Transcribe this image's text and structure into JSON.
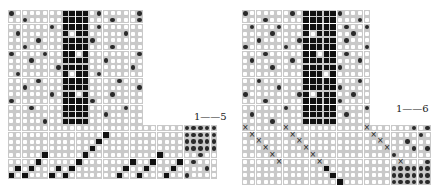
{
  "figure": {
    "panels": [
      {
        "id": "left",
        "origin": [
          8,
          10
        ],
        "cell": 6.75,
        "upper_cols": 20,
        "upper_rows": 17,
        "lower_cols": 31,
        "lower_rows": 8,
        "label": "1——5",
        "label_pos": [
          194,
          111
        ],
        "upper_fill_cols": [
          8,
          9,
          10,
          11
        ],
        "upper_dots": [
          [
            0,
            0
          ],
          [
            9,
            0
          ],
          [
            13,
            0
          ],
          [
            19,
            0
          ],
          [
            2,
            1
          ],
          [
            15,
            1
          ],
          [
            19,
            1
          ],
          [
            6,
            2
          ],
          [
            13,
            2
          ],
          [
            1,
            3
          ],
          [
            17,
            3
          ],
          [
            4,
            4
          ],
          [
            9,
            4
          ],
          [
            12,
            4
          ],
          [
            2,
            5
          ],
          [
            15,
            5
          ],
          [
            0,
            6
          ],
          [
            5,
            6
          ],
          [
            11,
            6
          ],
          [
            19,
            6
          ],
          [
            3,
            7
          ],
          [
            14,
            7
          ],
          [
            7,
            8
          ],
          [
            18,
            8
          ],
          [
            1,
            9
          ],
          [
            13,
            9
          ],
          [
            4,
            10
          ],
          [
            10,
            10
          ],
          [
            16,
            10
          ],
          [
            2,
            11
          ],
          [
            19,
            11
          ],
          [
            6,
            12
          ],
          [
            15,
            12
          ],
          [
            0,
            13
          ],
          [
            12,
            13
          ],
          [
            3,
            14
          ],
          [
            17,
            14
          ],
          [
            8,
            15
          ],
          [
            14,
            15
          ],
          [
            5,
            16
          ]
        ],
        "upper_fill_gaps": [
          [
            9,
            3
          ],
          [
            10,
            6
          ],
          [
            9,
            9
          ],
          [
            10,
            12
          ]
        ],
        "lower_fill": [
          [
            14,
            1
          ],
          [
            13,
            2
          ],
          [
            12,
            3
          ],
          [
            11,
            4
          ],
          [
            10,
            5
          ],
          [
            4,
            5
          ],
          [
            9,
            6
          ],
          [
            3,
            6
          ],
          [
            8,
            7
          ],
          [
            2,
            7
          ],
          [
            1,
            6
          ],
          [
            0,
            7
          ],
          [
            5,
            4
          ],
          [
            6,
            7
          ],
          [
            7,
            6
          ],
          [
            17,
            6
          ],
          [
            16,
            7
          ],
          [
            22,
            4
          ],
          [
            21,
            5
          ],
          [
            20,
            6
          ],
          [
            19,
            7
          ],
          [
            18,
            5
          ],
          [
            23,
            7
          ],
          [
            24,
            6
          ],
          [
            25,
            5
          ]
        ],
        "treadle_fill": [
          [
            26,
            0
          ],
          [
            27,
            0
          ],
          [
            28,
            0
          ],
          [
            29,
            0
          ],
          [
            30,
            0
          ],
          [
            26,
            1
          ],
          [
            27,
            1
          ],
          [
            28,
            1
          ],
          [
            29,
            1
          ],
          [
            30,
            1
          ],
          [
            26,
            2
          ],
          [
            27,
            2
          ],
          [
            28,
            2
          ],
          [
            29,
            2
          ],
          [
            30,
            2
          ],
          [
            26,
            3
          ],
          [
            27,
            3
          ],
          [
            28,
            3
          ],
          [
            29,
            3
          ],
          [
            30,
            3
          ],
          [
            28,
            4
          ],
          [
            27,
            5
          ],
          [
            29,
            6
          ],
          [
            26,
            7
          ]
        ]
      },
      {
        "id": "right",
        "origin": [
          242,
          10
        ],
        "cell": 6.75,
        "upper_cols": 19,
        "upper_rows": 17,
        "lower_cols": 28,
        "lower_rows": 9,
        "label": "1——6",
        "label_pos": [
          396,
          103
        ],
        "upper_fill_cols": [
          9,
          10,
          11,
          12,
          13
        ],
        "upper_dots": [
          [
            0,
            0
          ],
          [
            7,
            0
          ],
          [
            14,
            0
          ],
          [
            3,
            1
          ],
          [
            17,
            1
          ],
          [
            1,
            2
          ],
          [
            5,
            2
          ],
          [
            15,
            2
          ],
          [
            18,
            2
          ],
          [
            4,
            3
          ],
          [
            11,
            3
          ],
          [
            16,
            3
          ],
          [
            2,
            4
          ],
          [
            8,
            4
          ],
          [
            15,
            4
          ],
          [
            0,
            5
          ],
          [
            6,
            5
          ],
          [
            18,
            5
          ],
          [
            3,
            6
          ],
          [
            15,
            6
          ],
          [
            1,
            7
          ],
          [
            7,
            7
          ],
          [
            17,
            7
          ],
          [
            4,
            8
          ],
          [
            14,
            8
          ],
          [
            10,
            9
          ],
          [
            2,
            10
          ],
          [
            17,
            10
          ],
          [
            5,
            11
          ],
          [
            14,
            11
          ],
          [
            0,
            12
          ],
          [
            8,
            12
          ],
          [
            16,
            12
          ],
          [
            3,
            13
          ],
          [
            14,
            13
          ],
          [
            6,
            14
          ],
          [
            18,
            14
          ],
          [
            1,
            15
          ],
          [
            15,
            15
          ],
          [
            4,
            16
          ]
        ],
        "upper_fill_gaps": [
          [
            10,
            3
          ],
          [
            11,
            6
          ],
          [
            12,
            9
          ],
          [
            10,
            12
          ]
        ],
        "lower_cross": [
          [
            0,
            0
          ],
          [
            1,
            1
          ],
          [
            2,
            2
          ],
          [
            3,
            3
          ],
          [
            4,
            4
          ],
          [
            5,
            5
          ],
          [
            6,
            0
          ],
          [
            7,
            1
          ],
          [
            8,
            2
          ],
          [
            9,
            3
          ],
          [
            10,
            4
          ],
          [
            11,
            5
          ],
          [
            18,
            0
          ],
          [
            19,
            1
          ],
          [
            20,
            2
          ],
          [
            21,
            3
          ],
          [
            22,
            4
          ],
          [
            23,
            5
          ]
        ],
        "lower_fill": [
          [
            12,
            6
          ],
          [
            13,
            7
          ],
          [
            14,
            8
          ],
          [
            15,
            9
          ],
          [
            16,
            10
          ],
          [
            17,
            11
          ]
        ],
        "treadle_fill": [
          [
            25,
            0
          ],
          [
            27,
            0
          ],
          [
            26,
            1
          ],
          [
            24,
            2
          ],
          [
            25,
            3
          ],
          [
            27,
            3
          ],
          [
            22,
            4
          ],
          [
            27,
            5
          ],
          [
            22,
            6
          ],
          [
            23,
            6
          ],
          [
            24,
            6
          ],
          [
            25,
            6
          ],
          [
            26,
            6
          ],
          [
            27,
            6
          ],
          [
            22,
            7
          ],
          [
            23,
            7
          ],
          [
            24,
            7
          ],
          [
            25,
            7
          ],
          [
            26,
            7
          ],
          [
            27,
            7
          ],
          [
            22,
            8
          ],
          [
            23,
            8
          ],
          [
            24,
            8
          ],
          [
            25,
            8
          ],
          [
            26,
            8
          ],
          [
            27,
            8
          ]
        ]
      }
    ]
  }
}
